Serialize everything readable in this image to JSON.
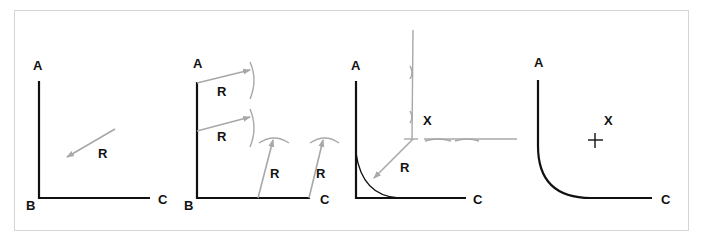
{
  "figure": {
    "colors": {
      "line": "#111111",
      "construction": "#a8a8a8",
      "frame": "#d4d4d4"
    },
    "panels": [
      {
        "step": 1,
        "labels": {
          "a": "A",
          "b": "B",
          "c": "C",
          "r": "R"
        }
      },
      {
        "step": 2,
        "labels": {
          "a": "A",
          "b": "B",
          "c": "C",
          "r1": "R",
          "r2": "R",
          "r3": "R",
          "r4": "R"
        }
      },
      {
        "step": 3,
        "labels": {
          "a": "A",
          "c": "C",
          "x": "X",
          "r": "R"
        }
      },
      {
        "step": 4,
        "labels": {
          "a": "A",
          "c": "C",
          "x": "X"
        }
      }
    ]
  }
}
